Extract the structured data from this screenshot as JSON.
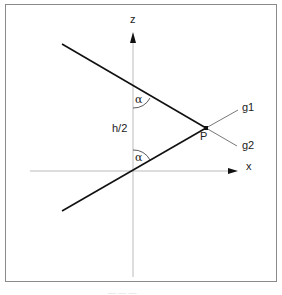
{
  "diagram": {
    "axes": {
      "x_label": "x",
      "z_label": "z"
    },
    "lines": [
      {
        "name": "g1",
        "label": "g1"
      },
      {
        "name": "g2",
        "label": "g2"
      }
    ],
    "point": {
      "label": "P"
    },
    "angle_label": "α",
    "distance_label": "h/2",
    "caption": "— — —"
  }
}
